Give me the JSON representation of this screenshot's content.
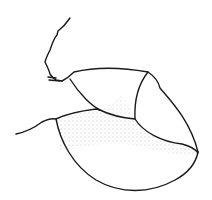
{
  "illustration": {
    "description": "Line drawing of a rounded shell-like body with a thin jointed appendage",
    "colors": {
      "stroke": "#1a1a1a",
      "background": "#ffffff",
      "stipple": "#555555"
    }
  }
}
